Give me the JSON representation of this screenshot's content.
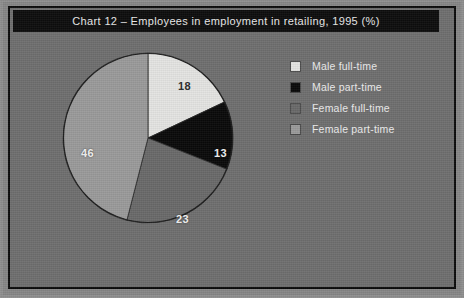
{
  "chart_data": {
    "type": "pie",
    "title": "Chart 12 – Employees in employment in retailing, 1995 (%)",
    "unit": "%",
    "legend_position": "right",
    "grid": false,
    "start_angle_deg": 0,
    "direction": "clockwise",
    "categories": [
      "Male full-time",
      "Male part-time",
      "Female full-time",
      "Female part-time"
    ],
    "values": [
      18,
      13,
      23,
      46
    ],
    "colors": [
      "#e4e4e2",
      "#0a0a0a",
      "#6a6a6a",
      "#9a9a9a"
    ],
    "slices": [
      {
        "label": "Male full-time",
        "value": 18,
        "display": "18",
        "color": "#e4e4e2",
        "label_color": "dark",
        "start_deg": 0,
        "end_deg": 64.8
      },
      {
        "label": "Male part-time",
        "value": 13,
        "display": "13",
        "color": "#0a0a0a",
        "label_color": "light",
        "start_deg": 64.8,
        "end_deg": 111.6
      },
      {
        "label": "Female full-time",
        "value": 23,
        "display": "23",
        "color": "#6a6a6a",
        "label_color": "light",
        "start_deg": 111.6,
        "end_deg": 194.4
      },
      {
        "label": "Female part-time",
        "value": 46,
        "display": "46",
        "color": "#9a9a9a",
        "label_color": "light",
        "start_deg": 194.4,
        "end_deg": 360
      }
    ]
  },
  "title": {
    "text": "Chart 12 – Employees in employment in retailing, 1995 (%)"
  },
  "legend": {
    "items": [
      {
        "label": "Male full-time",
        "color": "#e4e4e2"
      },
      {
        "label": "Male part-time",
        "color": "#0a0a0a"
      },
      {
        "label": "Female full-time",
        "color": "#6a6a6a"
      },
      {
        "label": "Female part-time",
        "color": "#9a9a9a"
      }
    ]
  },
  "labels": {
    "male_full_time": "18",
    "male_part_time": "13",
    "female_full_time": "23",
    "female_part_time": "46"
  },
  "theme": {
    "page_background": "#8f8f8f",
    "frame_background": "#6f6f6f",
    "frame_border": "#0b0b0b",
    "title_bar_background": "#0d0d0d",
    "title_text_color": "#e9e9e9",
    "legend_text_color": "#ececec"
  }
}
